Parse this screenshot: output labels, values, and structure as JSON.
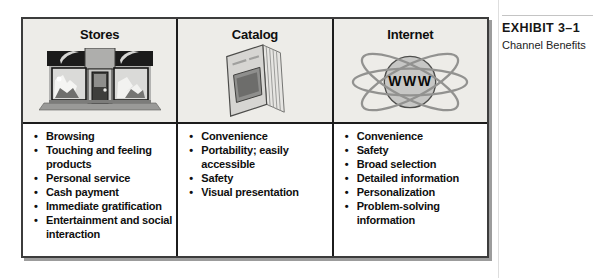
{
  "exhibit": {
    "label": "EXHIBIT 3–1",
    "caption": "Channel Benefits"
  },
  "icons": {
    "www_label": "WWW"
  },
  "table": {
    "columns": [
      {
        "title": "Stores",
        "icon": "storefront-icon",
        "benefits": [
          "Browsing",
          "Touching and feeling products",
          "Personal service",
          "Cash payment",
          "Immediate gratification",
          "Entertainment and social interaction"
        ]
      },
      {
        "title": "Catalog",
        "icon": "catalog-icon",
        "benefits": [
          "Convenience",
          "Portability; easily accessible",
          "Safety",
          "Visual presentation"
        ]
      },
      {
        "title": "Internet",
        "icon": "www-globe-icon",
        "benefits": [
          "Convenience",
          "Safety",
          "Broad selection",
          "Detailed information",
          "Personalization",
          "Problem-solving information"
        ]
      }
    ]
  },
  "colors": {
    "header_bg": "#edece8",
    "cell_bg": "#ffffff",
    "table_border": "#3c3c3c",
    "grid_line": "#1c1c1c",
    "shadow": "#9c9c9c",
    "caption_rule": "#c4c4c4"
  }
}
